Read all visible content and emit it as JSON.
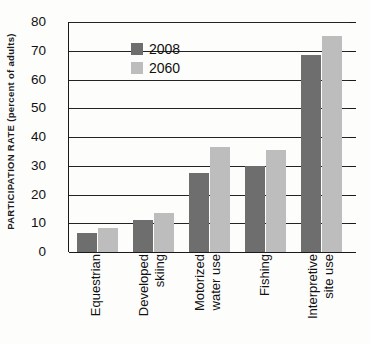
{
  "chart_data": {
    "type": "bar",
    "title": "",
    "subtitle": "",
    "xlabel": "",
    "ylabel": "PARTICIPATION RATE (percent of adults)",
    "ylim": [
      0,
      80
    ],
    "ytick_values": [
      0,
      10,
      20,
      30,
      40,
      50,
      60,
      70,
      80
    ],
    "ytick_labels": [
      "0",
      "10",
      "20",
      "30",
      "40",
      "50",
      "60",
      "70",
      "80"
    ],
    "grid": true,
    "legend_position": "upper-left-inside",
    "categories": [
      "Equestrian",
      "Developed skiing",
      "Motorized water use",
      "Fishing",
      "Interpretive site use"
    ],
    "category_lines": [
      [
        "Equestrian"
      ],
      [
        "Developed",
        "skiing"
      ],
      [
        "Motorized",
        "water use"
      ],
      [
        "Fishing"
      ],
      [
        "Interpretive",
        "site use"
      ]
    ],
    "series": [
      {
        "name": "2008",
        "color": "#6e6e6e",
        "values": [
          6.5,
          11,
          27.5,
          30,
          68.5
        ]
      },
      {
        "name": "2060",
        "color": "#bdbdbd",
        "values": [
          8.5,
          13.5,
          36.5,
          35.5,
          75
        ]
      }
    ]
  },
  "legend": {
    "items": [
      {
        "label": "2008",
        "color": "#6e6e6e"
      },
      {
        "label": "2060",
        "color": "#bdbdbd"
      }
    ]
  },
  "axis": {
    "y_title": "PARTICIPATION RATE (percent of adults)"
  },
  "colors": {
    "series_2008": "#6e6e6e",
    "series_2060": "#bdbdbd",
    "axis": "#1a1a1a",
    "background": "#fdfdfc"
  }
}
